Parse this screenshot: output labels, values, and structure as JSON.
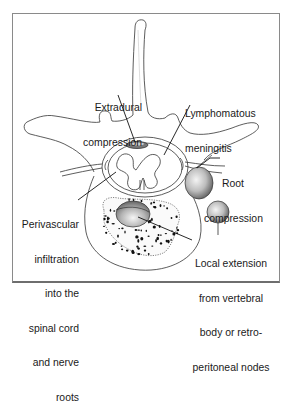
{
  "figure": {
    "labels": {
      "extradural": [
        "Extradural",
        "compression"
      ],
      "meningitis": [
        "Lymphomatous",
        "meningitis"
      ],
      "root": [
        "Root",
        "compression"
      ],
      "perivascular": [
        "Perivascular",
        "infiltration",
        "into the",
        "spinal cord",
        "and nerve",
        "roots"
      ],
      "local": [
        "Local extension",
        "from vertebral",
        "body or retro-",
        "peritoneal nodes"
      ]
    },
    "colors": {
      "line": "#333333",
      "frame": "#8a8a8a",
      "node_light": "#f2f2f2",
      "node_dark": "#6f6f6f",
      "dots": "#111111"
    }
  }
}
